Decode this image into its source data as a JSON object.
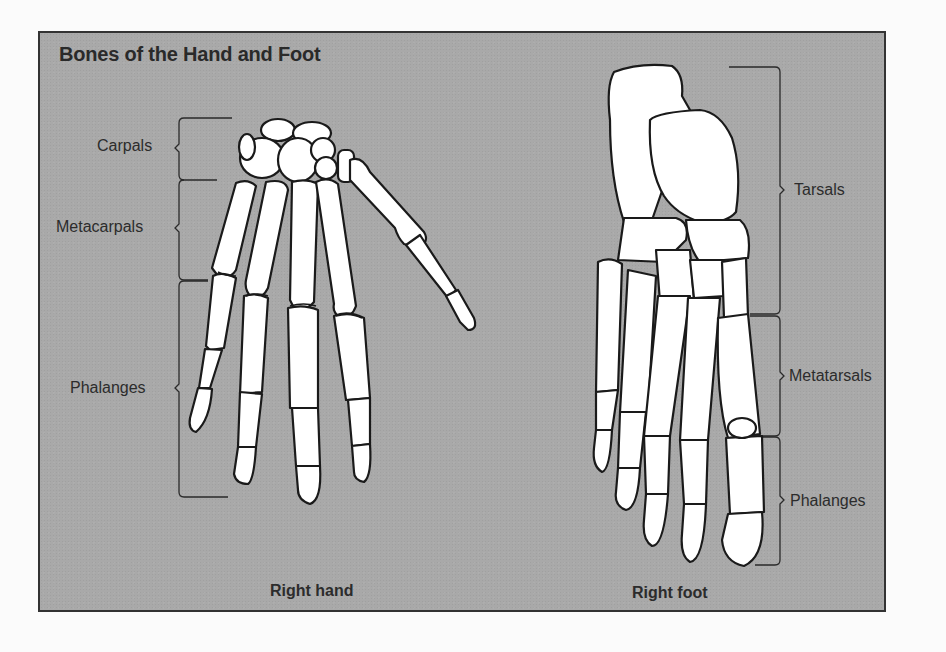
{
  "figure": {
    "title": "Bones of the Hand and Foot",
    "background_color": "#a9a9a9",
    "border_color": "#333333",
    "bone_fill": "#ffffff",
    "bone_outline": "#1a1a1a"
  },
  "hand": {
    "caption": "Right hand",
    "labels": [
      {
        "text": "Carpals"
      },
      {
        "text": "Metacarpals"
      },
      {
        "text": "Phalanges"
      }
    ]
  },
  "foot": {
    "caption": "Right foot",
    "labels": [
      {
        "text": "Tarsals"
      },
      {
        "text": "Metatarsals"
      },
      {
        "text": "Phalanges"
      }
    ]
  }
}
